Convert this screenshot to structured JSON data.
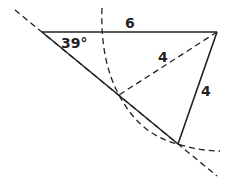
{
  "diagram": {
    "type": "geometry-triangle-construction",
    "angle_label": "39°",
    "top_side_label": "6",
    "dashed_side_label": "4",
    "right_side_label": "4",
    "stroke_color": "#222222",
    "points": {
      "A": [
        42,
        32
      ],
      "B": [
        217,
        32
      ],
      "C": [
        178,
        144
      ],
      "D": [
        119,
        95
      ]
    }
  }
}
